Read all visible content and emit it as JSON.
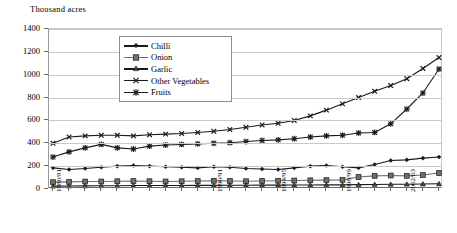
{
  "chart_data": {
    "type": "line",
    "title": "",
    "ylabel": "Thousand acres",
    "xlabel": "",
    "ylim": [
      0,
      1400
    ],
    "yticks": [
      0,
      200,
      400,
      600,
      800,
      1000,
      1200,
      1400
    ],
    "grid": true,
    "legend_position": "top-center-inside",
    "categories": [
      "1980/81",
      "1981/82",
      "1982/83",
      "1983/84",
      "1984/85",
      "1985/86",
      "1986/87",
      "1987/88",
      "1988/89",
      "1989/90",
      "1990/91",
      "1991/92",
      "1992/93",
      "1993/94",
      "1994/95",
      "1995/96",
      "1996/97",
      "1997/98",
      "1998/99",
      "1999/00",
      "2000/01",
      "2001/02",
      "2002/03",
      "2003/04",
      "2004/05"
    ],
    "xtick_labels": [
      "1980/81",
      "1990/91",
      "1994/95",
      "1998/99",
      "2002/03"
    ],
    "series": [
      {
        "name": "Chilli",
        "marker": "diamond",
        "values": [
          185,
          170,
          180,
          190,
          200,
          205,
          200,
          195,
          190,
          185,
          195,
          190,
          180,
          175,
          170,
          185,
          200,
          205,
          195,
          185,
          215,
          250,
          255,
          270,
          280
        ]
      },
      {
        "name": "Onion",
        "marker": "square",
        "values": [
          60,
          62,
          65,
          66,
          68,
          70,
          68,
          66,
          68,
          70,
          72,
          70,
          68,
          70,
          72,
          74,
          76,
          78,
          80,
          105,
          115,
          118,
          115,
          122,
          140
        ]
      },
      {
        "name": "Garlic",
        "marker": "triangle",
        "values": [
          25,
          26,
          27,
          28,
          28,
          30,
          30,
          30,
          31,
          32,
          32,
          33,
          33,
          34,
          34,
          35,
          35,
          36,
          36,
          38,
          40,
          41,
          42,
          44,
          46
        ]
      },
      {
        "name": "Other Vegetables",
        "marker": "cross",
        "values": [
          400,
          455,
          465,
          470,
          470,
          465,
          475,
          480,
          485,
          495,
          505,
          520,
          540,
          560,
          575,
          600,
          640,
          690,
          745,
          800,
          855,
          905,
          965,
          1055,
          1150
        ]
      },
      {
        "name": "Fruits",
        "marker": "asterisk",
        "values": [
          280,
          325,
          360,
          390,
          360,
          350,
          375,
          385,
          390,
          395,
          400,
          405,
          415,
          425,
          430,
          440,
          455,
          465,
          470,
          490,
          495,
          570,
          700,
          840,
          1050
        ]
      }
    ]
  }
}
